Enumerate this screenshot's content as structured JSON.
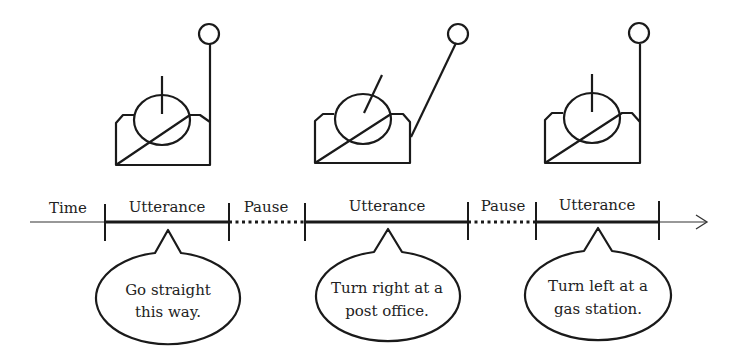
{
  "timeline": {
    "time_label": "Time",
    "segments": [
      {
        "type": "utterance",
        "label": "Utterance"
      },
      {
        "type": "pause",
        "label": "Pause"
      },
      {
        "type": "utterance",
        "label": "Utterance"
      },
      {
        "type": "pause",
        "label": "Pause"
      },
      {
        "type": "utterance",
        "label": "Utterance"
      }
    ]
  },
  "bubbles": [
    {
      "lines": [
        "Go straight",
        "this way."
      ]
    },
    {
      "lines": [
        "Turn right at a",
        "post office."
      ]
    },
    {
      "lines": [
        "Turn left at a",
        "gas station."
      ]
    }
  ],
  "figures": [
    {
      "name": "robot-neutral",
      "head": "upright",
      "arm": "up"
    },
    {
      "name": "robot-pointing-right",
      "head": "tilted-right",
      "arm": "diagonal-right"
    },
    {
      "name": "robot-neutral",
      "head": "upright",
      "arm": "up"
    }
  ],
  "colors": {
    "line": "#1a1a1a",
    "background": "#ffffff"
  }
}
